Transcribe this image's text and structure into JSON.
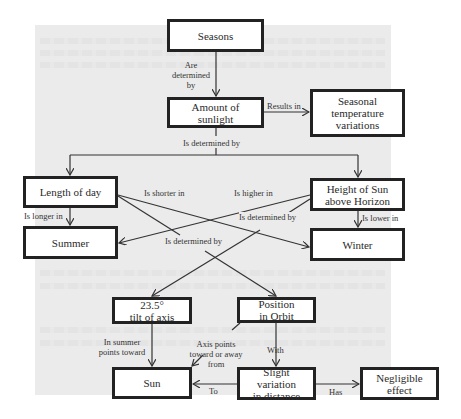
{
  "nodes": {
    "seasons": "Seasons",
    "sunlight": "Amount of sunlight",
    "temperature_line1": "Seasonal",
    "temperature_line2": "temperature",
    "temperature_line3": "variations",
    "length_of_day": "Length of day",
    "height_line1": "Height of Sun",
    "height_line2": "above Horizon",
    "summer": "Summer",
    "winter": "Winter",
    "tilt_line1": "23.5°",
    "tilt_line2": "tilt of axis",
    "orbit_line1": "Position",
    "orbit_line2": "in Orbit",
    "sun": "Sun",
    "distance_line1": "Slight variation",
    "distance_line2": "in distance",
    "negligible_line1": "Negligible",
    "negligible_line2": "effect"
  },
  "edges": {
    "are_determined_by_1": "Are",
    "are_determined_by_2": "determined",
    "are_determined_by_3": "by",
    "results_in": "Results in",
    "is_determined_by_top": "Is determined by",
    "is_shorter_in": "Is shorter in",
    "is_higher_in": "Is higher in",
    "is_longer_in": "Is longer in",
    "is_lower_in": "Is lower in",
    "is_determined_by_right": "Is determined by",
    "is_determined_by_left": "Is determined by",
    "in_summer_1": "In summer",
    "in_summer_2": "points toward",
    "axis_points_1": "Axis points",
    "axis_points_2": "toward or away",
    "axis_points_3": "from",
    "with": "With",
    "to": "To",
    "has": "Has"
  }
}
